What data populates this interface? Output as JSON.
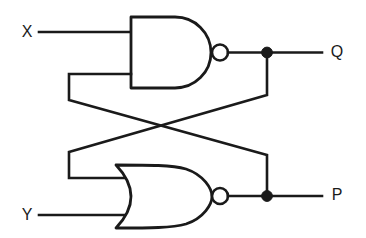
{
  "diagram": {
    "background_color": "#ffffff",
    "line_color": "#1a1a1a",
    "width": 366,
    "height": 238
  },
  "labels": {
    "input_x": "X",
    "input_y": "Y",
    "output_q": "Q",
    "output_p": "P"
  },
  "gates": [
    {
      "id": "nand-gate",
      "type": "NAND",
      "inputs": [
        "X",
        "P"
      ],
      "output": "Q",
      "inverted_output": true
    },
    {
      "id": "nor-gate",
      "type": "NOR",
      "inputs": [
        "Q",
        "Y"
      ],
      "output": "P",
      "inverted_output": true
    }
  ],
  "nets": [
    {
      "id": "net-x",
      "from": "X",
      "to": "nand-gate.in1"
    },
    {
      "id": "net-y",
      "from": "Y",
      "to": "nor-gate.in2"
    },
    {
      "id": "net-q",
      "from": "nand-gate.out",
      "to": "Q"
    },
    {
      "id": "net-p",
      "from": "nor-gate.out",
      "to": "P"
    },
    {
      "id": "net-q-feedback",
      "from": "Q",
      "to": "nor-gate.in1"
    },
    {
      "id": "net-p-feedback",
      "from": "P",
      "to": "nand-gate.in2"
    }
  ],
  "junctions": [
    {
      "id": "junction-q",
      "net": "net-q"
    },
    {
      "id": "junction-p",
      "net": "net-p"
    }
  ]
}
